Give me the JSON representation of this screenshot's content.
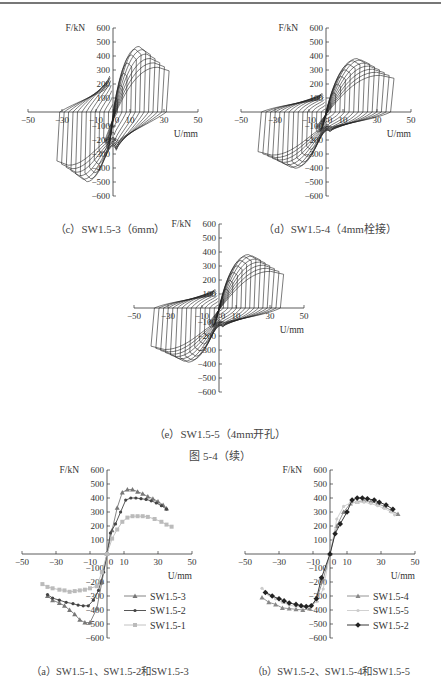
{
  "page": {
    "figure_continued_caption": "图 5-4（续）"
  },
  "chart_data": [
    {
      "id": "c",
      "type": "line",
      "subtype": "hysteresis",
      "title": "（c）SW1.5-3（6mm）",
      "xlabel": "U/mm",
      "ylabel": "F/kN",
      "xlim": [
        -50,
        50
      ],
      "ylim": [
        -600,
        600
      ],
      "x_ticks": [
        -50,
        -30,
        -10,
        0,
        10,
        30,
        50
      ],
      "y_ticks": [
        600,
        500,
        400,
        300,
        200,
        100,
        -100,
        -200,
        -300,
        -400,
        -500,
        -600
      ],
      "peak_positive": {
        "x": 14,
        "y": 470
      },
      "peak_negative": {
        "x": -25,
        "y": -500
      },
      "max_disp_positive": 33,
      "max_disp_negative": -33,
      "loops": 12
    },
    {
      "id": "d",
      "type": "line",
      "subtype": "hysteresis",
      "title": "（d）SW1.5-4（4mm栓接）",
      "xlabel": "U/mm",
      "ylabel": "F/kN",
      "xlim": [
        -50,
        50
      ],
      "ylim": [
        -600,
        600
      ],
      "x_ticks": [
        -50,
        -30,
        -10,
        0,
        10,
        30,
        50
      ],
      "y_ticks": [
        600,
        500,
        400,
        300,
        200,
        100,
        -100,
        -200,
        -300,
        -400,
        -500,
        -600
      ],
      "peak_positive": {
        "x": 20,
        "y": 385
      },
      "peak_negative": {
        "x": -18,
        "y": -405
      },
      "max_disp_positive": 40,
      "max_disp_negative": -40,
      "loops": 14
    },
    {
      "id": "e",
      "type": "line",
      "subtype": "hysteresis",
      "title": "（e）SW1.5-5（4mm开孔）",
      "xlabel": "U/mm",
      "ylabel": "F/kN",
      "xlim": [
        -50,
        50
      ],
      "ylim": [
        -600,
        600
      ],
      "x_ticks": [
        -50,
        -30,
        -10,
        0,
        10,
        30,
        50
      ],
      "y_ticks": [
        600,
        500,
        400,
        300,
        200,
        100,
        -100,
        -200,
        -300,
        -400,
        -500,
        -600
      ],
      "peak_positive": {
        "x": 18,
        "y": 385
      },
      "peak_negative": {
        "x": -20,
        "y": -390
      },
      "max_disp_positive": 38,
      "max_disp_negative": -40,
      "loops": 14
    },
    {
      "id": "a",
      "type": "line",
      "subtype": "skeleton",
      "title": "（a）SW1.5-1、SW1.5-2和SW1.5-3",
      "xlabel": "U/mm",
      "ylabel": "F/kN",
      "xlim": [
        -50,
        50
      ],
      "ylim": [
        -600,
        600
      ],
      "x_ticks": [
        -50,
        -30,
        -10,
        0,
        10,
        30,
        50
      ],
      "y_ticks": [
        600,
        500,
        400,
        300,
        200,
        100,
        -100,
        -200,
        -300,
        -400,
        -500,
        -600
      ],
      "legend": [
        "SW1.5-3",
        "SW1.5-2",
        "SW1.5-1"
      ],
      "legend_position": "lower-right",
      "series": [
        {
          "name": "SW1.5-3",
          "color": "#777777",
          "marker": "triangle",
          "x": [
            -35,
            -32,
            -28,
            -25,
            -22,
            -19,
            -16,
            -13,
            -10,
            -6,
            -3,
            0,
            3,
            6,
            9,
            12,
            15,
            18,
            21,
            24,
            27,
            30,
            33,
            35
          ],
          "y": [
            -300,
            -330,
            -350,
            -370,
            -400,
            -430,
            -470,
            -490,
            -490,
            -390,
            -200,
            0,
            170,
            330,
            440,
            460,
            460,
            445,
            430,
            410,
            395,
            375,
            350,
            325
          ]
        },
        {
          "name": "SW1.5-2",
          "color": "#444444",
          "marker": "dot",
          "x": [
            -35,
            -32,
            -28,
            -24,
            -20,
            -17,
            -14,
            -11,
            -8,
            -5,
            -2,
            0,
            2,
            5,
            8,
            11,
            14,
            17,
            20,
            23,
            26,
            29,
            32,
            35
          ],
          "y": [
            -290,
            -315,
            -330,
            -345,
            -355,
            -365,
            -370,
            -370,
            -330,
            -260,
            -130,
            0,
            150,
            215,
            300,
            385,
            400,
            400,
            395,
            390,
            380,
            365,
            345,
            320
          ]
        },
        {
          "name": "SW1.5-1",
          "color": "#bbbbbb",
          "marker": "square",
          "x": [
            -38,
            -35,
            -32,
            -28,
            -25,
            -22,
            -19,
            -16,
            -13,
            -10,
            -6,
            -3,
            0,
            3,
            6,
            9,
            12,
            15,
            18,
            21,
            24,
            28,
            32,
            35,
            38
          ],
          "y": [
            -215,
            -235,
            -245,
            -255,
            -260,
            -270,
            -265,
            -260,
            -255,
            -245,
            -230,
            -130,
            0,
            110,
            175,
            230,
            260,
            270,
            270,
            270,
            265,
            250,
            230,
            210,
            195
          ]
        }
      ]
    },
    {
      "id": "b",
      "type": "line",
      "subtype": "skeleton",
      "title": "（b）SW1.5-2、SW1.5-4和SW1.5-5",
      "xlabel": "U/mm",
      "ylabel": "F/kN",
      "xlim": [
        -50,
        50
      ],
      "ylim": [
        -600,
        600
      ],
      "x_ticks": [
        -50,
        -30,
        -10,
        0,
        10,
        30,
        50
      ],
      "y_ticks": [
        600,
        500,
        400,
        300,
        200,
        100,
        -100,
        -200,
        -300,
        -400,
        -500,
        -600
      ],
      "legend": [
        "SW1.5-4",
        "SW1.5-5",
        "SW1.5-2"
      ],
      "legend_position": "lower-right",
      "series": [
        {
          "name": "SW1.5-4",
          "color": "#888888",
          "marker": "triangle",
          "x": [
            -40,
            -36,
            -32,
            -28,
            -24,
            -20,
            -16,
            -12,
            -8,
            -4,
            0,
            4,
            8,
            12,
            16,
            20,
            24,
            28,
            32,
            36,
            40
          ],
          "y": [
            -310,
            -345,
            -360,
            -385,
            -390,
            -395,
            -400,
            -390,
            -330,
            -180,
            0,
            200,
            300,
            360,
            375,
            380,
            375,
            360,
            340,
            310,
            285
          ]
        },
        {
          "name": "SW1.5-5",
          "color": "#cccccc",
          "marker": "dot",
          "x": [
            -40,
            -36,
            -32,
            -28,
            -24,
            -20,
            -16,
            -12,
            -8,
            -4,
            0,
            4,
            8,
            12,
            16,
            20,
            24,
            28,
            32,
            36,
            38
          ],
          "y": [
            -245,
            -290,
            -320,
            -345,
            -365,
            -375,
            -380,
            -375,
            -340,
            -250,
            0,
            250,
            340,
            365,
            370,
            370,
            360,
            345,
            325,
            300,
            280
          ]
        },
        {
          "name": "SW1.5-2",
          "color": "#222222",
          "marker": "diamond",
          "x": [
            -38,
            -34,
            -30,
            -27,
            -24,
            -20,
            -17,
            -14,
            -11,
            -8,
            -5,
            0,
            3,
            6,
            10,
            13,
            16,
            19,
            22,
            26,
            29,
            33,
            37
          ],
          "y": [
            -275,
            -300,
            -320,
            -335,
            -350,
            -360,
            -370,
            -375,
            -370,
            -320,
            -170,
            0,
            145,
            215,
            300,
            385,
            400,
            400,
            395,
            385,
            370,
            350,
            320
          ]
        }
      ]
    }
  ],
  "figure_labels": {
    "c": "（c）SW1.5-3（6mm）",
    "d": "（d）SW1.5-4（4mm栓接）",
    "e": "（e）SW1.5-5（4mm开孔）",
    "a": "（a）SW1.5-1、SW1.5-2和SW1.5-3",
    "b": "（b）SW1.5-2、SW1.5-4和SW1.5-5"
  }
}
